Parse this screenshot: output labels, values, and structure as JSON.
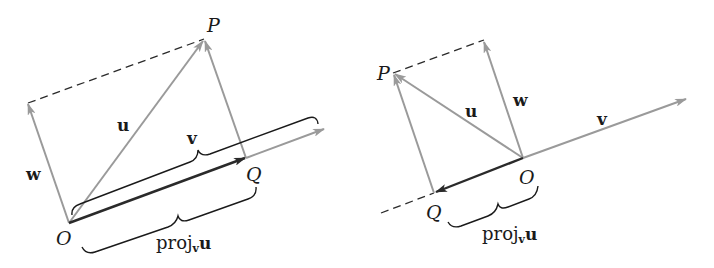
{
  "figure": {
    "colors": {
      "gray_vector": "#9a9a9a",
      "dark_vector": "#2a2a2a",
      "dashed": "#2a2a2a",
      "brace": "#1a1a1a",
      "background": "#ffffff"
    },
    "left_panel": {
      "points": {
        "O": {
          "label": "O",
          "x": 69,
          "y": 223
        },
        "P": {
          "label": "P",
          "x": 204,
          "y": 39
        },
        "Q": {
          "label": "Q",
          "x": 246,
          "y": 158
        }
      },
      "vectors": {
        "u": {
          "label": "u"
        },
        "v": {
          "label": "v"
        },
        "w": {
          "label": "w"
        }
      },
      "proj_label": {
        "main": "proj",
        "sub": "v",
        "vec": "u"
      }
    },
    "right_panel": {
      "points": {
        "O": {
          "label": "O",
          "x": 523,
          "y": 158
        },
        "P": {
          "label": "P",
          "x": 393,
          "y": 73
        },
        "Q": {
          "label": "Q",
          "x": 434,
          "y": 193
        }
      },
      "vectors": {
        "u": {
          "label": "u"
        },
        "v": {
          "label": "v"
        },
        "w": {
          "label": "w"
        }
      },
      "proj_label": {
        "main": "proj",
        "sub": "v",
        "vec": "u"
      }
    }
  }
}
